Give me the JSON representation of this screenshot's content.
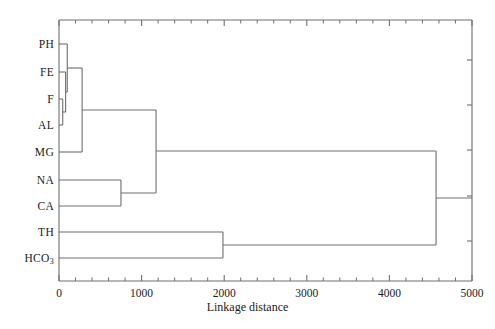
{
  "chart_data": {
    "type": "dendrogram",
    "title": "",
    "xlabel": "Linkage distance",
    "ylabel": "",
    "xlim": [
      0,
      5000
    ],
    "xticks": [
      0,
      1000,
      2000,
      3000,
      4000,
      5000
    ],
    "xtick_labels": [
      "0",
      "1000",
      "2000",
      "3000",
      "4000",
      "5000"
    ],
    "minor_ticks_per_interval": 4,
    "grid": false,
    "legend": null,
    "orientation": "horizontal",
    "leaves": [
      {
        "label": "PH",
        "sub": "",
        "y": 44
      },
      {
        "label": "FE",
        "sub": "",
        "y": 72
      },
      {
        "label": "F",
        "sub": "",
        "y": 99
      },
      {
        "label": "AL",
        "sub": "",
        "y": 125
      },
      {
        "label": "MG",
        "sub": "",
        "y": 152
      },
      {
        "label": "NA",
        "sub": "",
        "y": 180
      },
      {
        "label": "CA",
        "sub": "",
        "y": 206
      },
      {
        "label": "TH",
        "sub": "",
        "y": 232
      },
      {
        "label": "HCO",
        "sub": "3",
        "y": 258
      }
    ],
    "merges": [
      {
        "id": "m1",
        "members": [
          "F",
          "AL"
        ],
        "distance": 45,
        "y": 112
      },
      {
        "id": "m2",
        "members": [
          "FE",
          "m1"
        ],
        "distance": 80,
        "y": 92
      },
      {
        "id": "m3",
        "members": [
          "PH",
          "m2"
        ],
        "distance": 100,
        "y": 68
      },
      {
        "id": "m4",
        "members": [
          "m3",
          "MG"
        ],
        "distance": 280,
        "y": 110
      },
      {
        "id": "m5",
        "members": [
          "NA",
          "CA"
        ],
        "distance": 750,
        "y": 193
      },
      {
        "id": "m6",
        "members": [
          "m4",
          "m5"
        ],
        "distance": 1175,
        "y": 151
      },
      {
        "id": "m7",
        "members": [
          "TH",
          "HCO3"
        ],
        "distance": 1985,
        "y": 245
      },
      {
        "id": "m8",
        "members": [
          "m6",
          "m7"
        ],
        "distance": 4565,
        "y": 198
      }
    ],
    "colors": {
      "line": "#6e6e6e",
      "axis": "#6e6e6e",
      "text": "#1a1a1a",
      "background": "#ffffff"
    }
  },
  "axis": {
    "x_label_text": "Linkage distance"
  }
}
